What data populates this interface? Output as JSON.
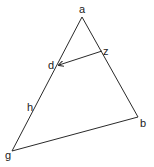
{
  "diagram": {
    "type": "geometry-triangle",
    "points": {
      "a": {
        "label": "a",
        "x": 82,
        "y": 17
      },
      "b": {
        "label": "b",
        "x": 138,
        "y": 117
      },
      "g": {
        "label": "g",
        "x": 12,
        "y": 151
      },
      "d": {
        "label": "d",
        "x": 58,
        "y": 65
      },
      "z": {
        "label": "z",
        "x": 102,
        "y": 51
      },
      "h": {
        "label": "h",
        "x": 33,
        "y": 108
      }
    },
    "edges": [
      {
        "from": "a",
        "to": "b"
      },
      {
        "from": "b",
        "to": "g"
      },
      {
        "from": "g",
        "to": "a"
      },
      {
        "from": "z",
        "to": "d",
        "arrow": "end"
      }
    ],
    "colors": {
      "line": "#2a2a2a",
      "text": "#222222",
      "background": "#ffffff"
    }
  }
}
